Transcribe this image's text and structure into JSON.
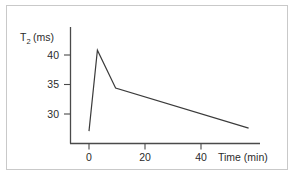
{
  "chart_data": {
    "type": "line",
    "title": "",
    "subtitle": "",
    "xlabel": "Time (min)",
    "ylabel": "T2 (ms)",
    "ylabel_base": "T",
    "ylabel_sub": "2",
    "ylabel_unit": "(ms)",
    "xlim": [
      -7,
      61
    ],
    "ylim": [
      25.5,
      42.5
    ],
    "grid": false,
    "legend": null,
    "x_ticks": [
      0,
      20,
      40
    ],
    "x_tick_labels": [
      "0",
      "20",
      "40"
    ],
    "y_ticks": [
      30,
      35,
      40
    ],
    "y_tick_labels": [
      "30",
      "35",
      "40"
    ],
    "series": [
      {
        "name": "T2 relaxation",
        "x": [
          0,
          3,
          9.5,
          57
        ],
        "y": [
          27.1,
          40.8,
          34.4,
          27.6
        ]
      }
    ],
    "annotations": [],
    "colors": {
      "line": "#3b3b3b",
      "axis": "#4a4a4a",
      "text": "#2b2b2b",
      "background": "#ffffff",
      "frame_border": "#c9c9c9"
    }
  }
}
